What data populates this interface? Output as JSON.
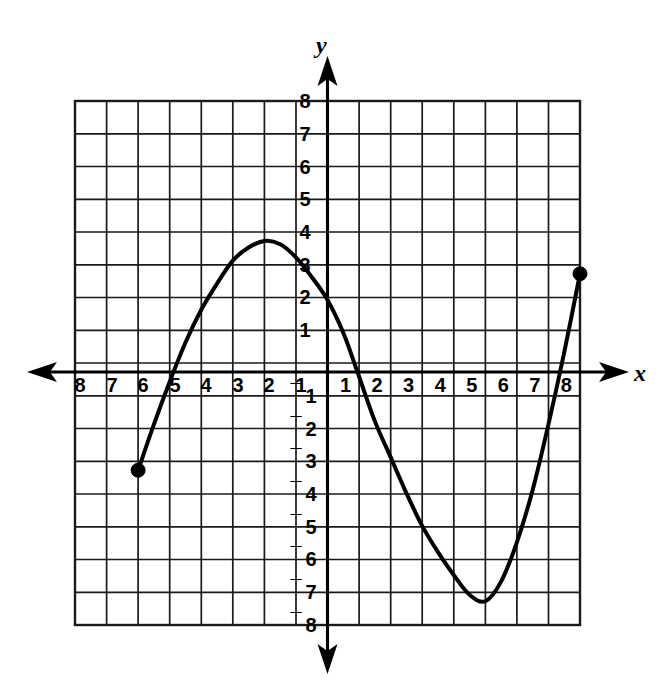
{
  "figure": {
    "kind": "coordinate-plane-graph",
    "background_color": "#ffffff",
    "ink_color": "#000000",
    "grid_color": "#1a1a1a"
  },
  "axes": {
    "x_axis_label": "x",
    "y_axis_label": "y",
    "x_ticks_negative": [
      "8",
      "7",
      "6",
      "5",
      "4",
      "3",
      "2",
      "1"
    ],
    "x_ticks_positive": [
      "1",
      "2",
      "3",
      "4",
      "5",
      "6",
      "7",
      "8"
    ],
    "y_ticks_positive": [
      "8",
      "7",
      "6",
      "5",
      "4",
      "3",
      "2",
      "1"
    ],
    "y_ticks_negative": [
      "1",
      "2",
      "3",
      "4",
      "5",
      "6",
      "7",
      "8"
    ],
    "negative_sign_glyph": "¯",
    "x_arrow_left": "arrow-left-icon",
    "x_arrow_right": "arrow-right-icon",
    "y_arrow_up": "arrow-up-icon",
    "y_arrow_down": "arrow-down-icon"
  },
  "chart_data": {
    "type": "line",
    "title": "",
    "xlabel": "x",
    "ylabel": "y",
    "xlim": [
      -8,
      8
    ],
    "ylim": [
      -8,
      8
    ],
    "xticks": [
      -8,
      -7,
      -6,
      -5,
      -4,
      -3,
      -2,
      -1,
      1,
      2,
      3,
      4,
      5,
      6,
      7,
      8
    ],
    "yticks": [
      -8,
      -7,
      -6,
      -5,
      -4,
      -3,
      -2,
      -1,
      1,
      2,
      3,
      4,
      5,
      6,
      7,
      8
    ],
    "grid": true,
    "grid_spacing": 1,
    "legend": "none",
    "series": [
      {
        "name": "curve",
        "style": "solid-curve",
        "endpoints_marked": true,
        "x": [
          -6,
          -5.5,
          -5,
          -4.5,
          -4,
          -3.5,
          -3,
          -2.5,
          -2,
          -1.5,
          -1,
          -0.5,
          0,
          0.5,
          0.95,
          1.5,
          2,
          2.5,
          3,
          3.5,
          4,
          4.5,
          5,
          5.5,
          6,
          6.5,
          7,
          7.5,
          8
        ],
        "values": [
          -3,
          -1.6,
          -0.3,
          0.9,
          1.9,
          2.7,
          3.4,
          3.8,
          4,
          3.9,
          3.5,
          2.9,
          2.2,
          1.2,
          0,
          -1.5,
          -2.6,
          -3.7,
          -4.7,
          -5.5,
          -6.2,
          -6.8,
          -7,
          -6.4,
          -5.2,
          -3.6,
          -1.6,
          0.6,
          3
        ]
      }
    ],
    "annotations": [
      {
        "name": "left-endpoint",
        "x": -6,
        "y": -3,
        "marker": "filled-circle"
      },
      {
        "name": "local-maximum",
        "x": -2,
        "y": 4,
        "marker": "none"
      },
      {
        "name": "x-intercept",
        "x": 0.95,
        "y": 0,
        "marker": "none"
      },
      {
        "name": "local-minimum",
        "x": 5,
        "y": -7,
        "marker": "none"
      },
      {
        "name": "right-endpoint",
        "x": 8,
        "y": 3,
        "marker": "filled-circle"
      }
    ]
  }
}
